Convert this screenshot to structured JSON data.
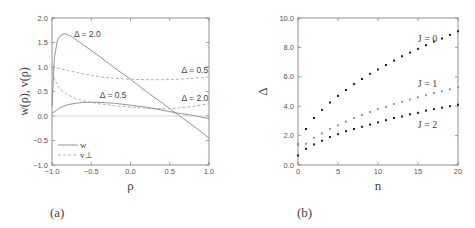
{
  "chart_data": [
    {
      "panel": "(a)",
      "type": "line",
      "xlabel": "ρ",
      "ylabel": "w(ρ), v(ρ)",
      "xlim": [
        -1.0,
        1.0
      ],
      "ylim": [
        -1.0,
        2.0
      ],
      "xticks": [
        "-1.0",
        "-0.5",
        "0.0",
        "0.5",
        "1.0"
      ],
      "yticks": [
        "-1.0",
        "-0.5",
        "0.0",
        "0.5",
        "1.0",
        "1.5",
        "2.0"
      ],
      "grid": false,
      "legend": [
        {
          "label": "w",
          "style": "solid"
        },
        {
          "label": "v⊥",
          "style": "dashed"
        }
      ],
      "legend_position": "lower left",
      "series": [
        {
          "name": "w, Δ = 2.0",
          "style": "solid",
          "x": [
            -1.0,
            -0.97,
            -0.93,
            -0.88,
            -0.83,
            -0.75,
            -0.6,
            -0.4,
            -0.2,
            0.0,
            0.2,
            0.4,
            0.6,
            0.8,
            1.0
          ],
          "y": [
            0.2,
            1.2,
            1.55,
            1.66,
            1.68,
            1.62,
            1.45,
            1.22,
            0.98,
            0.75,
            0.5,
            0.27,
            0.03,
            -0.2,
            -0.45
          ]
        },
        {
          "name": "v⊥, Δ = 0.5",
          "style": "dashed",
          "x": [
            -1.0,
            -0.8,
            -0.6,
            -0.4,
            -0.2,
            0.0,
            0.2,
            0.4,
            0.6,
            0.8,
            1.0
          ],
          "y": [
            1.0,
            0.93,
            0.86,
            0.8,
            0.77,
            0.75,
            0.74,
            0.74,
            0.75,
            0.77,
            0.8
          ]
        },
        {
          "name": "v⊥, Δ = 2.0",
          "style": "dashed",
          "x": [
            -1.0,
            -0.97,
            -0.9,
            -0.8,
            -0.7,
            -0.6,
            -0.4,
            -0.2,
            0.0,
            0.2,
            0.4,
            0.5,
            0.6,
            0.8,
            1.0
          ],
          "y": [
            1.0,
            0.75,
            0.55,
            0.43,
            0.36,
            0.31,
            0.25,
            0.21,
            0.18,
            0.16,
            0.15,
            0.15,
            0.16,
            0.2,
            0.25
          ]
        },
        {
          "name": "w, Δ = 0.5",
          "style": "solid",
          "x": [
            -1.0,
            -0.9,
            -0.8,
            -0.7,
            -0.6,
            -0.5,
            -0.4,
            -0.2,
            0.0,
            0.2,
            0.4,
            0.6,
            0.8,
            1.0
          ],
          "y": [
            0.05,
            0.17,
            0.23,
            0.26,
            0.28,
            0.28,
            0.28,
            0.26,
            0.22,
            0.18,
            0.12,
            0.06,
            0.01,
            -0.05
          ]
        },
        {
          "name": "zero line",
          "style": "thin",
          "x": [
            -1.0,
            1.0
          ],
          "y": [
            0.0,
            0.0
          ]
        }
      ],
      "annotations": [
        {
          "text": "Δ = 2.0",
          "x": -0.55,
          "y": 1.62
        },
        {
          "text": "Δ = 0.5",
          "x": 0.82,
          "y": 0.87
        },
        {
          "text": "Δ = 0.5",
          "x": -0.22,
          "y": 0.36
        },
        {
          "text": "Δ = 2.0",
          "x": 0.82,
          "y": 0.31
        }
      ]
    },
    {
      "panel": "(b)",
      "type": "scatter",
      "xlabel": "n",
      "ylabel": "Δ",
      "xlim": [
        0,
        20
      ],
      "ylim": [
        0.0,
        10.0
      ],
      "xticks": [
        "0",
        "5",
        "10",
        "15",
        "20"
      ],
      "yticks": [
        "0.0",
        "2.0",
        "4.0",
        "6.0",
        "8.0",
        "10.0"
      ],
      "grid": false,
      "x": [
        0,
        1,
        2,
        3,
        4,
        5,
        6,
        7,
        8,
        9,
        10,
        11,
        12,
        13,
        14,
        15,
        16,
        17,
        18,
        19,
        20
      ],
      "series": [
        {
          "name": "J = 0",
          "color": "#222222",
          "values": [
            1.4,
            2.45,
            3.2,
            3.75,
            4.25,
            4.7,
            5.1,
            5.5,
            5.85,
            6.2,
            6.5,
            6.8,
            7.1,
            7.4,
            7.65,
            7.9,
            8.15,
            8.4,
            8.6,
            8.85,
            9.1
          ]
        },
        {
          "name": "J = 1",
          "color": "#999999",
          "values": [
            1.4,
            1.45,
            1.85,
            2.15,
            2.45,
            2.7,
            2.95,
            3.2,
            3.4,
            3.6,
            3.8,
            3.95,
            4.15,
            4.3,
            4.45,
            4.6,
            4.75,
            4.9,
            5.0,
            5.15,
            5.3
          ]
        },
        {
          "name": "J = 2",
          "color": "#222222",
          "values": [
            0.65,
            1.1,
            1.4,
            1.65,
            1.9,
            2.1,
            2.3,
            2.45,
            2.6,
            2.75,
            2.9,
            3.05,
            3.2,
            3.3,
            3.45,
            3.55,
            3.7,
            3.8,
            3.9,
            4.0,
            4.1
          ]
        }
      ],
      "annotations": [
        {
          "text": "J = 0",
          "x": 16.2,
          "y": 8.4
        },
        {
          "text": "J = 1",
          "x": 16.2,
          "y": 5.3
        },
        {
          "text": "J = 2",
          "x": 16.2,
          "y": 2.5
        }
      ]
    }
  ],
  "panels": {
    "a": {
      "label": "(a)"
    },
    "b": {
      "label": "(b)"
    }
  }
}
